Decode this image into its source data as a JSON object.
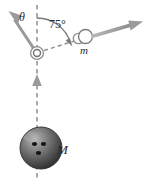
{
  "figure": {
    "background_color": "#ffffff",
    "width": 147,
    "height": 179
  },
  "labels": {
    "theta": "θ",
    "angle_75": "75°",
    "small_mass": "m",
    "large_mass": "M"
  },
  "colors": {
    "vector_gray": "#9a9a9a",
    "vector_gray_dark": "#8a8a8a",
    "dashed_gray": "#8e8e8e",
    "outline_gray": "#7a7a7a",
    "text_dark": "#2b2b2b",
    "ball_dark": "#3a3a3a",
    "ball_mid": "#6e6e6e",
    "ball_light": "#9d9d9d",
    "ball_hole": "#1c1c1c"
  },
  "geometry": {
    "pivot": {
      "x": 37,
      "y": 53
    },
    "small_mass_center": {
      "x": 84,
      "y": 37
    },
    "large_mass_center": {
      "x": 41,
      "y": 148
    },
    "large_mass_radius": 21,
    "vertical_line": {
      "x": 37,
      "y_top": 5,
      "y_bottom": 178
    },
    "theta_vector_tip": {
      "x": 9,
      "y": 14
    },
    "m_velocity_tip": {
      "x": 142,
      "y": 22
    },
    "angle_75_value": 75,
    "ball_holes": [
      {
        "x": 34,
        "y": 144,
        "r": 2.3
      },
      {
        "x": 43,
        "y": 144,
        "r": 2.3
      },
      {
        "x": 38,
        "y": 153,
        "r": 2.3
      }
    ]
  },
  "elements": {
    "theta_vector_name": "theta-velocity-vector",
    "m_vector_name": "small-mass-velocity-vector",
    "ball_vector_name": "large-mass-velocity-vector",
    "pivot_name": "pivot-ring",
    "arc_name": "angle-arc-75"
  }
}
